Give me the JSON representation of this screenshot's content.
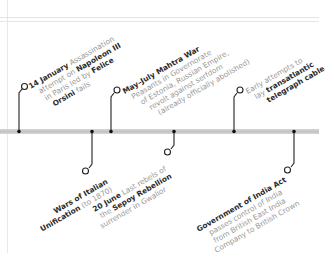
{
  "timeline": {
    "bar_color": "#c8c8c8",
    "connector_color": "#222222",
    "events_above": [
      {
        "id": "orsini",
        "date": "14 January",
        "lines": [
          "Assassination",
          "attempt on",
          "Napoleon III",
          "in Paris led by",
          "Felice",
          "Orsini",
          "fails"
        ],
        "line1_bold": "14 January",
        "line1_rest": " Assassination",
        "line2_rest": "attempt on ",
        "line2_bold": "Napoleon III",
        "line3_rest": "in Paris led by ",
        "line3_bold": "Felice",
        "line4_bold": "Orsini",
        "line4_rest": " fails"
      },
      {
        "id": "mahtra",
        "line1_bold": "May–July Mahtra War",
        "line2": "Peasants in Governorate",
        "line3": "of Estonia, Russian Empire,",
        "line4": "revolt against serfdom",
        "line5": "(already officially abolished)"
      },
      {
        "id": "telegraph",
        "line1": "Early attempts to",
        "line2_rest": "lay ",
        "line2_bold": "transatlantic",
        "line3_bold": "telegraph cable"
      }
    ],
    "events_below": [
      {
        "id": "italian",
        "line1_bold": "Wars of Italian",
        "line2_bold": "Unification",
        "line2_rest": " (to 1870)"
      },
      {
        "id": "sepoy",
        "line1_bold": "20 June",
        "line1_rest": " Last rebels of",
        "line2_rest": "the ",
        "line2_bold": "Sepoy Rebellion",
        "line3": "surrender in Gwalior"
      },
      {
        "id": "india-act",
        "line1_bold": "Government of India Act",
        "line2": "passes control of India",
        "line3": "from British East India",
        "line4": "Company to British Crown"
      }
    ]
  }
}
